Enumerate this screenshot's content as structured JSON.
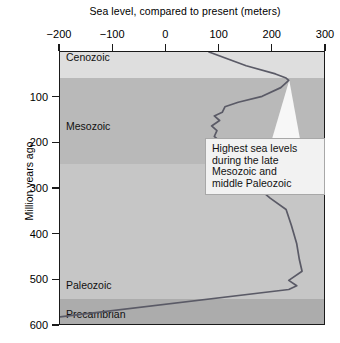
{
  "chart_data": {
    "type": "line",
    "title": "Sea level, compared to present (meters)",
    "xlabel": "Sea level, compared to present (meters)",
    "ylabel": "Million years ago",
    "xlim": [
      -200,
      300
    ],
    "ylim": [
      0,
      600
    ],
    "y_inverted": true,
    "grid": false,
    "legend_position": "none",
    "x_ticks": [
      -200,
      -100,
      0,
      100,
      200,
      300
    ],
    "x_tick_labels": [
      "−200",
      "−100",
      "0",
      "100",
      "200",
      "300"
    ],
    "y_ticks": [
      100,
      200,
      300,
      400,
      500,
      600
    ],
    "y_tick_labels": [
      "100",
      "200",
      "300",
      "400",
      "500",
      "600"
    ],
    "series": [
      {
        "name": "Sea level curve",
        "color": "#5a5a66",
        "points": [
          [
            80,
            0
          ],
          [
            150,
            30
          ],
          [
            205,
            48
          ],
          [
            225,
            57
          ],
          [
            230,
            62
          ],
          [
            215,
            78
          ],
          [
            180,
            97
          ],
          [
            135,
            110
          ],
          [
            110,
            120
          ],
          [
            105,
            132
          ],
          [
            90,
            140
          ],
          [
            100,
            150
          ],
          [
            85,
            162
          ],
          [
            95,
            172
          ],
          [
            90,
            185
          ],
          [
            105,
            200
          ],
          [
            150,
            215
          ],
          [
            155,
            245
          ],
          [
            175,
            262
          ],
          [
            190,
            285
          ],
          [
            175,
            300
          ],
          [
            195,
            320
          ],
          [
            225,
            345
          ],
          [
            235,
            380
          ],
          [
            245,
            420
          ],
          [
            250,
            455
          ],
          [
            255,
            480
          ],
          [
            230,
            500
          ],
          [
            245,
            512
          ],
          [
            230,
            520
          ],
          [
            -200,
            580
          ]
        ]
      }
    ],
    "era_bands": [
      {
        "name": "Cenozoic",
        "from_mya": 0,
        "to_mya": 57,
        "color": "#dedede",
        "label": "Cenozoic",
        "label_y_mya": 14
      },
      {
        "name": "Mesozoic",
        "from_mya": 57,
        "to_mya": 245,
        "color": "#b9b9b9",
        "label": "Mesozoic",
        "label_y_mya": 165
      },
      {
        "name": "Paleozoic",
        "from_mya": 245,
        "to_mya": 540,
        "color": "#c6c6c6",
        "label": "Paleozoic",
        "label_y_mya": 512
      },
      {
        "name": "Precambrian",
        "from_mya": 540,
        "to_mya": 600,
        "color": "#acacac",
        "label": "Precambrian",
        "label_y_mya": 575
      }
    ],
    "annotations": [
      {
        "name": "highest-sea-levels-callout",
        "lines": [
          "Highest sea levels",
          "during the late",
          "Mesozoic and",
          "middle Paleozoic"
        ],
        "points_to": {
          "x": 230,
          "y": 62
        }
      }
    ]
  },
  "colors": {
    "axis": "#1a1a1a",
    "curve": "#5a5a66",
    "callout_bg": "#f2f2f2",
    "callout_border": "#a8a8a8",
    "page_bg": "#ffffff"
  }
}
